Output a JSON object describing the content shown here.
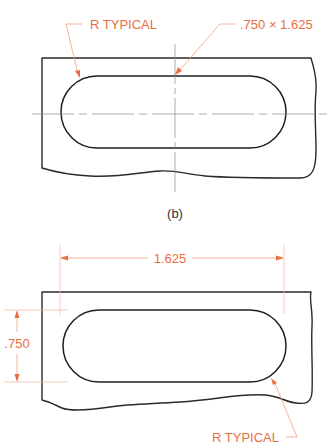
{
  "figure_top": {
    "callouts": {
      "radius_note": "R TYPICAL",
      "slot_size_note": ".750 × 1.625"
    },
    "caption": "(b)"
  },
  "figure_bottom": {
    "dimensions": {
      "length": "1.625",
      "width": ".750"
    },
    "callouts": {
      "radius_note": "R TYPICAL"
    }
  },
  "colors": {
    "dimension": "#ea6e43",
    "outline": "#2a2a2a",
    "centerline": "#8a8a8a"
  }
}
